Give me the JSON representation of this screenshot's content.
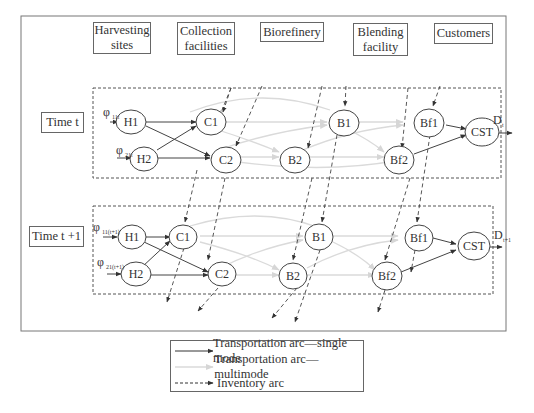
{
  "headers": [
    {
      "label": "Harvesting sites"
    },
    {
      "label": "Collection facilities"
    },
    {
      "label": "Biorefinery"
    },
    {
      "label": "Blending facility"
    },
    {
      "label": "Customers"
    }
  ],
  "periods": [
    {
      "label": "Time t",
      "inputs": [
        "φ11t",
        "φ21t"
      ],
      "demand": "Dt",
      "nodes": {
        "H1": "H1",
        "H2": "H2",
        "C1": "C1",
        "C2": "C2",
        "B1": "B1",
        "B2": "B2",
        "Bf1": "Bf1",
        "Bf2": "Bf2",
        "CST": "CST"
      }
    },
    {
      "label": "Time t +1",
      "inputs": [
        "φ11(t+1)",
        "φ21(t+1)"
      ],
      "demand": "Dt+1",
      "nodes": {
        "H1": "H1",
        "H2": "H2",
        "C1": "C1",
        "C2": "C2",
        "B1": "B1",
        "B2": "B2",
        "Bf1": "Bf1",
        "Bf2": "Bf2",
        "CST": "CST"
      }
    }
  ],
  "labels": {
    "time_t": "Time t",
    "time_t1": "Time t +1",
    "phi": "φ",
    "sub_11t": "11t",
    "sub_21t": "21t",
    "sub_11t1": "11(t+1)",
    "sub_21t1": "21(t+1)",
    "D": "D",
    "sub_t": "t",
    "sub_t1": "t+1"
  },
  "legend": {
    "items": [
      {
        "label": "Transportation arc—single mode",
        "style": "solid",
        "color": "#333333"
      },
      {
        "label": "Transportation arc—multimode",
        "style": "solid",
        "color": "#d8d8d8"
      },
      {
        "label": "Inventory arc",
        "style": "dashed",
        "color": "#333333"
      }
    ]
  },
  "colors": {
    "single_mode": "#333333",
    "multimode": "#d8d8d8",
    "inventory": "#333333"
  }
}
